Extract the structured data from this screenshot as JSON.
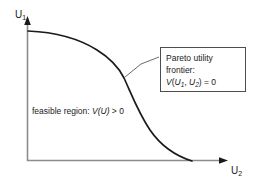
{
  "figure": {
    "type": "diagram",
    "axes": {
      "y_label": "U",
      "y_label_sub": "1",
      "x_label": "U",
      "x_label_sub": "2",
      "axis_color": "#808080",
      "arrow_color": "#1a1a1a"
    },
    "curve": {
      "name": "pareto-frontier-curve",
      "color": "#1a1a1a",
      "stroke_width": 1.6,
      "start_point": [
        28,
        31
      ],
      "end_point": [
        192,
        161
      ],
      "description": "Concave frontier: flat near the U1 axis, sharp bend near the middle, steep descent to the U2 axis"
    },
    "region_label": {
      "prefix": "feasible region: ",
      "function": "V(U)",
      "suffix": " > 0"
    },
    "callout": {
      "line1": "Pareto utility",
      "line2": "frontier:",
      "formula_v": "V",
      "formula_open": "(",
      "formula_u1": "U",
      "formula_u1_sub": "1",
      "formula_comma": ", ",
      "formula_u2": "U",
      "formula_u2_sub": "2",
      "formula_close": ")",
      "formula_eq": " = 0",
      "border_color": "#4d4d4d",
      "leader_from": [
        125,
        76
      ],
      "leader_to": [
        159,
        57
      ]
    }
  }
}
